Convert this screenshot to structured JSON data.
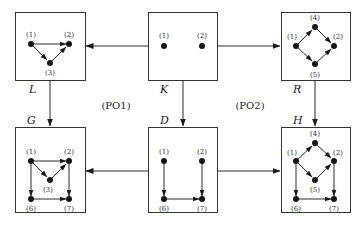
{
  "diagram": {
    "graphs": {
      "L": {
        "label": "L",
        "nodes": [
          "(1)",
          "(2)",
          "(3)"
        ],
        "edges": [
          [
            "1",
            "2"
          ],
          [
            "1",
            "3"
          ],
          [
            "3",
            "2"
          ]
        ]
      },
      "K": {
        "label": "K",
        "nodes": [
          "(1)",
          "(2)"
        ],
        "edges": []
      },
      "R": {
        "label": "R",
        "nodes": [
          "(4)",
          "(1)",
          "(2)",
          "(5)"
        ],
        "edges": [
          [
            "1",
            "4"
          ],
          [
            "4",
            "2"
          ],
          [
            "1",
            "5"
          ],
          [
            "5",
            "2"
          ]
        ]
      },
      "G": {
        "label": "G",
        "nodes": [
          "(1)",
          "(2)",
          "(3)",
          "(6)",
          "(7)"
        ],
        "edges": [
          [
            "1",
            "2"
          ],
          [
            "1",
            "3"
          ],
          [
            "3",
            "2"
          ],
          [
            "1",
            "6"
          ],
          [
            "2",
            "7"
          ],
          [
            "6",
            "7"
          ]
        ]
      },
      "D": {
        "label": "D",
        "nodes": [
          "(1)",
          "(2)",
          "(6)",
          "(7)"
        ],
        "edges": [
          [
            "1",
            "6"
          ],
          [
            "2",
            "7"
          ],
          [
            "6",
            "7"
          ]
        ]
      },
      "H": {
        "label": "H",
        "nodes": [
          "(4)",
          "(1)",
          "(2)",
          "(5)",
          "(6)",
          "(7)"
        ],
        "edges": [
          [
            "1",
            "4"
          ],
          [
            "4",
            "2"
          ],
          [
            "1",
            "5"
          ],
          [
            "5",
            "2"
          ],
          [
            "1",
            "6"
          ],
          [
            "2",
            "7"
          ],
          [
            "6",
            "7"
          ]
        ]
      }
    },
    "morphisms": [
      [
        "K",
        "L"
      ],
      [
        "K",
        "R"
      ],
      [
        "L",
        "G"
      ],
      [
        "K",
        "D"
      ],
      [
        "R",
        "H"
      ],
      [
        "D",
        "G"
      ],
      [
        "D",
        "H"
      ]
    ],
    "squares": {
      "left": "(PO1)",
      "right": "(PO2)"
    }
  },
  "labels": {
    "L": "L",
    "K": "K",
    "R": "R",
    "G": "G",
    "D": "D",
    "H": "H",
    "po1": "(PO1)",
    "po2": "(PO2)",
    "n1": "(1)",
    "n2": "(2)",
    "n3": "(3)",
    "n4": "(4)",
    "n5": "(5)",
    "n6": "(6)",
    "n7": "(7)"
  }
}
